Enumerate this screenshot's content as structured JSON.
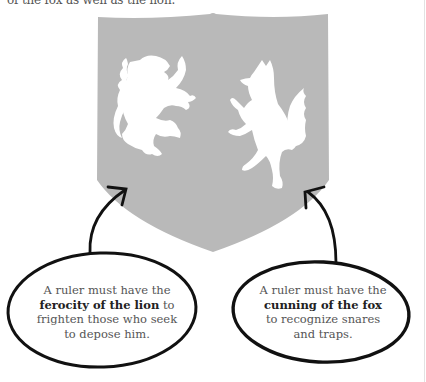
{
  "intro": {
    "partial_line": "of the fox as well as the lion."
  },
  "shield": {
    "color": "#b9b9b9",
    "figures": [
      "lion",
      "fox"
    ]
  },
  "callouts": [
    {
      "id": "lion",
      "line1": "A ruler must have the",
      "bold": "ferocity of the lion",
      "after_bold": " to",
      "line3": "frighten those who seek",
      "line4": "to depose him."
    },
    {
      "id": "fox",
      "line1": "A ruler must have the",
      "bold": "cunning of the fox",
      "line3": "to recognize snares",
      "line4": "and traps."
    }
  ],
  "colors": {
    "ink": "#111111",
    "text": "#555555",
    "bold_text": "#222222"
  }
}
